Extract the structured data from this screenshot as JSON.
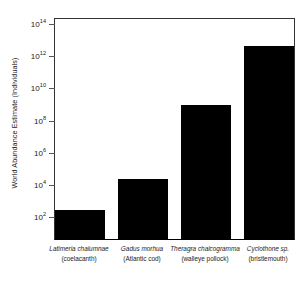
{
  "chart_data": {
    "type": "bar",
    "title": "",
    "xlabel": "",
    "ylabel": "World Abundance Estimate (Individuals)",
    "yscale": "log",
    "ylim": [
      1,
      100000000000000
    ],
    "ytick_labels": [
      "10²",
      "10⁴",
      "10⁶",
      "10⁸",
      "10¹⁰",
      "10¹²",
      "10¹⁴"
    ],
    "ytick_mantissas": [
      "10",
      "10",
      "10",
      "10",
      "10",
      "10",
      "10"
    ],
    "ytick_exponents": [
      "2",
      "4",
      "6",
      "8",
      "10",
      "12",
      "14"
    ],
    "ytick_values": [
      100,
      10000,
      1000000,
      100000000,
      10000000000,
      1000000000000,
      100000000000000
    ],
    "grid": false,
    "legend": "none",
    "bar_color": "#000000",
    "categories": [
      "Latimeria chalumnae (coelacanth)",
      "Gadus morhua (Atlantic cod)",
      "Theragra chalcogramma (walleye pollock)",
      "Cyclothone sp. (bristlemouth)"
    ],
    "values": [
      300,
      25000,
      1000000000,
      5000000000000
    ],
    "bars": [
      {
        "scientific_name": "Latimeria chalumnae",
        "common_name": "(coelacanth)",
        "value": 300,
        "log10_value": 2.48
      },
      {
        "scientific_name": "Gadus morhua",
        "common_name": "(Atlantic cod)",
        "value": 25000,
        "log10_value": 4.4
      },
      {
        "scientific_name": "Theragra chalcogramma",
        "common_name": "(walleye pollock)",
        "value": 1000000000,
        "log10_value": 9.0
      },
      {
        "scientific_name": "Cyclothone sp.",
        "common_name": "(bristlemouth)",
        "value": 5000000000000,
        "log10_value": 12.7
      }
    ]
  }
}
